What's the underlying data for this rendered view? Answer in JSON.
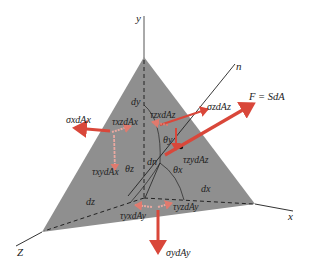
{
  "figure": {
    "axes": {
      "x_label": "x",
      "y_label": "y",
      "z_label": "Z",
      "normal_label": "n"
    },
    "differentials": {
      "dx": "dx",
      "dy": "dy",
      "dz": "dz",
      "dn": "dn"
    },
    "angles": {
      "theta_x": "θx",
      "theta_y": "θy",
      "theta_z": "θz"
    },
    "forces": {
      "resultant": "F = SdA",
      "sigma_x": "σxdAx",
      "sigma_y": "σydAy",
      "sigma_z": "σzdAz",
      "tau_xz": "τxzdAx",
      "tau_xy": "τxydAx",
      "tau_zx": "τzxdAz",
      "tau_zy": "τzydAz",
      "tau_yx": "τyxdAy",
      "tau_yz": "τyzdAy"
    },
    "colors": {
      "face": "#8f8f8f",
      "force": "#d9473a",
      "shear": "#e9a8a0",
      "line": "#222222"
    }
  }
}
